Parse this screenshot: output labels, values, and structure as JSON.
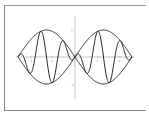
{
  "chart_data": {
    "type": "line",
    "title": "",
    "xlabel": "",
    "ylabel": "",
    "x_range": [
      -3.14159,
      3.14159
    ],
    "ylim": [
      -1.4,
      1.4
    ],
    "grid": false,
    "legend": null,
    "x_ticks": [
      {
        "value": -2,
        "label": "-2"
      },
      {
        "value": -1,
        "label": "-1"
      },
      {
        "value": 1,
        "label": "1"
      },
      {
        "value": 2,
        "label": "2"
      }
    ],
    "y_ticks": [
      {
        "value": 1,
        "label": "1"
      },
      {
        "value": -1,
        "label": "-1"
      }
    ],
    "series": [
      {
        "name": "upper-envelope",
        "formula": "sin(x) on [0,pi], -sin(x) on [-pi,0] (|sin x|)",
        "color": "#222222"
      },
      {
        "name": "lower-envelope",
        "formula": "-|sin x|",
        "color": "#222222"
      },
      {
        "name": "modulated-carrier",
        "formula": "sin(x)*cos(5x)",
        "color": "#222222"
      }
    ],
    "samples": {
      "x": [
        -3.1416,
        -2.5133,
        -1.885,
        -1.2566,
        -0.6283,
        0,
        0.6283,
        1.2566,
        1.885,
        2.5133,
        3.1416
      ],
      "envelope": [
        0.0,
        0.588,
        0.951,
        0.951,
        0.588,
        0.0,
        0.588,
        0.951,
        0.951,
        0.588,
        0.0
      ]
    }
  },
  "colors": {
    "line": "#222222",
    "axis": "#a0a0a0",
    "frame": "#8a8a8a",
    "background": "#ffffff"
  }
}
